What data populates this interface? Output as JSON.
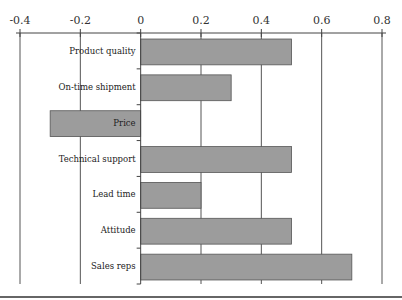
{
  "chart_data": {
    "type": "bar",
    "orientation": "horizontal",
    "title": "",
    "xlabel": "",
    "ylabel": "",
    "categories": [
      "Product quality",
      "On-time shipment",
      "Price",
      "Technical support",
      "Lead time",
      "Attitude",
      "Sales reps"
    ],
    "values": [
      0.5,
      0.3,
      -0.3,
      0.5,
      0.2,
      0.5,
      0.7
    ],
    "xlim": [
      -0.4,
      0.8
    ],
    "xticks": [
      -0.4,
      -0.2,
      0,
      0.2,
      0.4,
      0.6,
      0.8
    ],
    "xtick_labels": [
      "-0.4",
      "-0.2",
      "0",
      "0.2",
      "0.4",
      "0.6",
      "0.8"
    ],
    "x_axis_position": "top",
    "grid": true,
    "legend": null
  },
  "style": {
    "bar_fill": "#9c9c9c",
    "bar_stroke": "#555555",
    "grid_color": "#555555",
    "axis_color": "#444444"
  }
}
